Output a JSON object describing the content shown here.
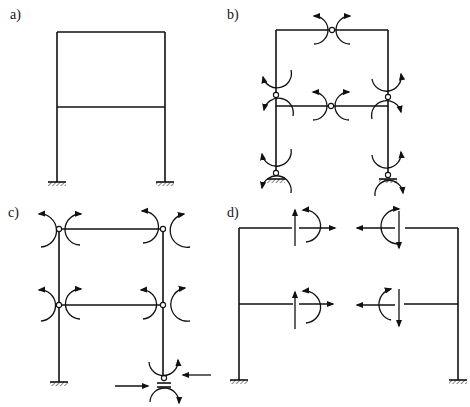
{
  "figure": {
    "panels": [
      {
        "id": "a",
        "label": "a)",
        "description": "Two-storey single-bay frame with fixed supports"
      },
      {
        "id": "b",
        "label": "b)",
        "description": "Frame with hinges inserted and redundant moment pairs"
      },
      {
        "id": "c",
        "label": "c)",
        "description": "Frame with hinges at beam ends and roller support, moment pairs and horizontal forces"
      },
      {
        "id": "d",
        "label": "d)",
        "description": "Frame cut at beam mid-spans with shear, normal force and moment pairs"
      }
    ],
    "colors": {
      "ink": "#111111",
      "background": "#ffffff"
    }
  }
}
